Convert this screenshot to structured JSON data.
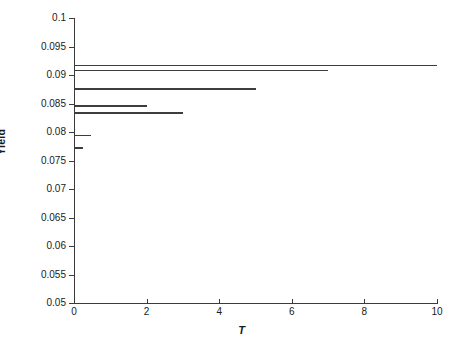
{
  "chart_data": {
    "type": "line",
    "title": "",
    "xlabel": "T",
    "ylabel": "Yield",
    "xlim": [
      0,
      10
    ],
    "ylim": [
      0.05,
      0.1
    ],
    "grid": false,
    "legend": null,
    "xticks": [
      0,
      2,
      4,
      6,
      8,
      10
    ],
    "xtick_labels": [
      "0",
      "2",
      "4",
      "6",
      "8",
      "10"
    ],
    "yticks": [
      0.05,
      0.055,
      0.06,
      0.065,
      0.07,
      0.075,
      0.08,
      0.085,
      0.09,
      0.095,
      0.1
    ],
    "ytick_labels": [
      "0.05",
      "0.055",
      "0.06",
      "0.065",
      "0.07",
      "0.075",
      "0.08",
      "0.085",
      "0.09",
      "0.095",
      "0.1"
    ],
    "series": [
      {
        "name": "segment-1",
        "x_start": 0,
        "x_end": 10.0,
        "y": 0.0918
      },
      {
        "name": "segment-2",
        "x_start": 0,
        "x_end": 7.0,
        "y": 0.0909
      },
      {
        "name": "segment-3",
        "x_start": 0,
        "x_end": 5.0,
        "y": 0.0877
      },
      {
        "name": "segment-4",
        "x_start": 0,
        "x_end": 2.0,
        "y": 0.0847
      },
      {
        "name": "segment-5",
        "x_start": 0,
        "x_end": 3.0,
        "y": 0.0835
      },
      {
        "name": "segment-6",
        "x_start": 0,
        "x_end": 0.47,
        "y": 0.0795
      },
      {
        "name": "segment-7",
        "x_start": 0,
        "x_end": 0.25,
        "y": 0.0773
      }
    ],
    "line_color": "#3d3d3d",
    "axis_color": "#3b3b3b",
    "background": "#ffffff"
  }
}
